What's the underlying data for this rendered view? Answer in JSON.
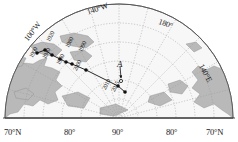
{
  "figure": {
    "kind": "polar-projection-map",
    "region": "Arctic",
    "background_color": "#ffffff",
    "land_color": "#b9b9b9",
    "ocean_color": "#f7f7f7",
    "graticule_color": "#9a9a9a",
    "track_color": "#111111"
  },
  "longitude_labels": [
    {
      "name": "lon-100w",
      "text": "100°W",
      "x": 23,
      "y": 38,
      "rotate": -52
    },
    {
      "name": "lon-140w",
      "text": "140°W",
      "x": 86,
      "y": 9,
      "rotate": -19
    },
    {
      "name": "lon-180",
      "text": "180°",
      "x": 160,
      "y": 18,
      "rotate": 19
    },
    {
      "name": "lon-140e",
      "text": "140°E",
      "x": 204,
      "y": 63,
      "rotate": 62
    }
  ],
  "axis_labels": {
    "name": "latitude-axis",
    "ticks": [
      {
        "text": "70°N",
        "x": 4
      },
      {
        "text": "80°",
        "x": 64
      },
      {
        "text": "90°",
        "x": 112
      },
      {
        "text": "80°",
        "x": 166
      },
      {
        "text": "70°N",
        "x": 206
      }
    ]
  },
  "chart_data": {
    "type": "scatter",
    "title": "",
    "xlabel": "",
    "ylabel": "",
    "series_name": "North magnetic pole drift track",
    "points": [
      {
        "year": "1900",
        "px": 37,
        "py": 53,
        "label_x": 28,
        "label_y": 56,
        "rotate": -62
      },
      {
        "year": "1920",
        "px": 45,
        "py": 50,
        "label_x": 45,
        "label_y": 40,
        "rotate": -62
      },
      {
        "year": "1940",
        "px": 52,
        "py": 55,
        "label_x": 41,
        "label_y": 57,
        "rotate": -62
      },
      {
        "year": "1960",
        "px": 60,
        "py": 59,
        "label_x": 55,
        "label_y": 63,
        "rotate": -62
      },
      {
        "year": "1980",
        "px": 66,
        "py": 62,
        "label_x": 64,
        "label_y": 46,
        "rotate": -62
      },
      {
        "year": "1990",
        "px": 72,
        "py": 64,
        "label_x": 77,
        "label_y": 50,
        "rotate": -62
      },
      {
        "year": "2000",
        "px": 86,
        "py": 70,
        "label_x": 72,
        "label_y": 69,
        "rotate": -62
      },
      {
        "year": "2010",
        "px": 118,
        "py": 86,
        "label_x": 101,
        "label_y": 88,
        "rotate": -62
      },
      {
        "year": "2015",
        "px": 125,
        "py": 92,
        "label_x": 110,
        "label_y": 90,
        "rotate": -62
      }
    ]
  },
  "annotations": [
    {
      "name": "point-a",
      "label": "A",
      "label_x": 117,
      "label_y": 60,
      "marker_x": 121,
      "marker_y": 81,
      "arrow_from_x": 120,
      "arrow_from_y": 66,
      "arrow_to_x": 121,
      "arrow_to_y": 78
    }
  ]
}
